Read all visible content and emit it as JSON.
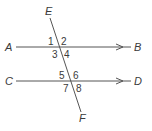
{
  "diagram": {
    "points": {
      "A": "A",
      "B": "B",
      "C": "C",
      "D": "D",
      "E": "E",
      "F": "F"
    },
    "angles": {
      "a1": "1",
      "a2": "2",
      "a3": "3",
      "a4": "4",
      "a5": "5",
      "a6": "6",
      "a7": "7",
      "a8": "8"
    },
    "lines": [
      {
        "name": "AB",
        "parallel_arrow": true
      },
      {
        "name": "CD",
        "parallel_arrow": true
      },
      {
        "name": "EF",
        "role": "transversal"
      }
    ],
    "colors": {
      "line": "#555555",
      "text": "#3a3a3a",
      "background": "#ffffff"
    }
  }
}
